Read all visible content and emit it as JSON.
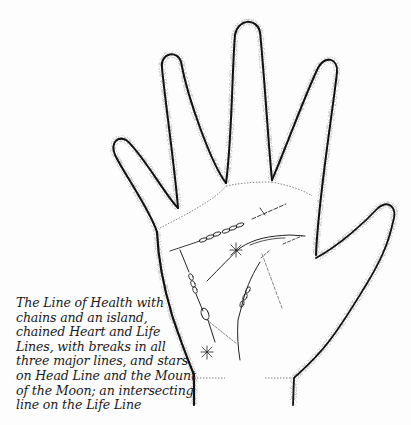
{
  "figure": {
    "caption_lines": [
      "The Line of Health with",
      "chains and an island,",
      "chained Heart and Life",
      "Lines, with breaks in all",
      "three major lines, and stars",
      "on Head Line and the Mount",
      "of the Moon; an intersecting",
      "line on the Life Line"
    ],
    "features": [
      "heart-line-chained",
      "head-line-with-star",
      "life-line-chained",
      "line-of-health-with-chains-and-island",
      "star-mount-of-moon",
      "intersecting-line-on-life-line"
    ],
    "colors": {
      "ink": "#111111",
      "stipple": "#9a9a9a",
      "paper": "#fdfdfd"
    }
  }
}
